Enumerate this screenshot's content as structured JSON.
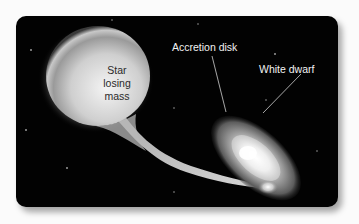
{
  "diagram": {
    "labels": {
      "star": "Star losing mass",
      "star_lines": [
        "Star",
        "losing",
        "mass"
      ],
      "accretion_disk": "Accretion disk",
      "white_dwarf": "White dwarf"
    },
    "colors": {
      "background": "#020202",
      "page": "#fbfbfb",
      "star_fill": "#d9d9d9",
      "label_dark": "#2a2a2a",
      "label_light": "#f2f2f2",
      "leader_line": "#cfcfcf"
    }
  }
}
